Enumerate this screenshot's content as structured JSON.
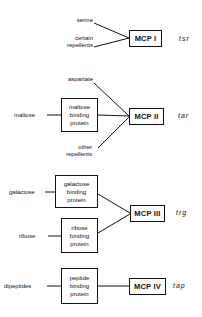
{
  "groups": [
    {
      "receptor": "MCP I",
      "gene": "tsr",
      "inputs": [
        {
          "label": "serine"
        },
        {
          "label_lines": [
            "certain",
            "repellents"
          ]
        }
      ]
    },
    {
      "receptor": "MCP II",
      "gene": "tar",
      "inputs": [
        {
          "label": "aspartate"
        },
        {
          "label": "maltose",
          "binding_protein": [
            "maltose",
            "binding",
            "protein"
          ]
        },
        {
          "label_lines": [
            "other",
            "repellents"
          ]
        }
      ]
    },
    {
      "receptor": "MCP III",
      "gene": "trg",
      "inputs": [
        {
          "label": "galactose",
          "binding_protein": [
            "galactose",
            "binding",
            "protein"
          ]
        },
        {
          "label": "ribose",
          "binding_protein": [
            "ribose",
            "binding",
            "protein"
          ]
        }
      ]
    },
    {
      "receptor": "MCP IV",
      "gene": "tap",
      "inputs": [
        {
          "label": "dipeptides",
          "binding_protein": [
            "peptide",
            "binding",
            "protein"
          ]
        }
      ]
    }
  ],
  "colors": {
    "line": "#111111",
    "background": "#ffffff"
  }
}
